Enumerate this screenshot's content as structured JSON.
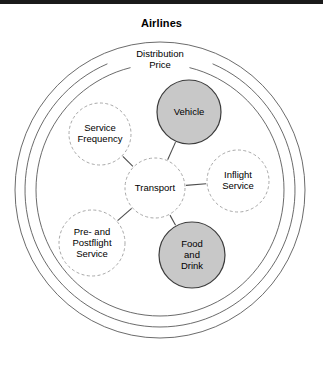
{
  "figure": {
    "title": "Airlines",
    "background_color": "#ffffff",
    "rule_color": "#1a1a1a"
  },
  "rings": [
    {
      "name": "airlines-ring",
      "label": "",
      "rx": 145,
      "ry": 148
    },
    {
      "name": "distribution-ring",
      "label": "Distribution",
      "rx": 135,
      "ry": 137
    },
    {
      "name": "price-ring",
      "label": "Price",
      "rx": 124,
      "ry": 126
    }
  ],
  "nodes": [
    {
      "id": "transport",
      "label_lines": [
        "Transport"
      ],
      "style": "dashed",
      "fill": "#ffffff",
      "cx": 155,
      "cy": 188,
      "r": 30
    },
    {
      "id": "vehicle",
      "label_lines": [
        "Vehicle"
      ],
      "style": "shaded",
      "fill": "#c8c8c8",
      "cx": 189,
      "cy": 112,
      "r": 32
    },
    {
      "id": "service-frequency",
      "label_lines": [
        "Service",
        "Frequency"
      ],
      "style": "dashed",
      "fill": "#ffffff",
      "cx": 100,
      "cy": 134,
      "r": 31
    },
    {
      "id": "inflight-service",
      "label_lines": [
        "Inflight",
        "Service"
      ],
      "style": "dashed",
      "fill": "#ffffff",
      "cx": 238,
      "cy": 181,
      "r": 31
    },
    {
      "id": "pre-and-postflight-service",
      "label_lines": [
        "Pre- and",
        "Postflight",
        "Service"
      ],
      "style": "dashed",
      "fill": "#ffffff",
      "cx": 92,
      "cy": 243,
      "r": 33
    },
    {
      "id": "food-and-drink",
      "label_lines": [
        "Food",
        "and",
        "Drink"
      ],
      "style": "shaded",
      "fill": "#c8c8c8",
      "cx": 192,
      "cy": 255,
      "r": 33
    }
  ],
  "connectors": [
    {
      "from": "transport",
      "to": "vehicle"
    },
    {
      "from": "transport",
      "to": "service-frequency"
    },
    {
      "from": "transport",
      "to": "inflight-service"
    },
    {
      "from": "transport",
      "to": "pre-and-postflight-service"
    },
    {
      "from": "transport",
      "to": "food-and-drink"
    }
  ]
}
